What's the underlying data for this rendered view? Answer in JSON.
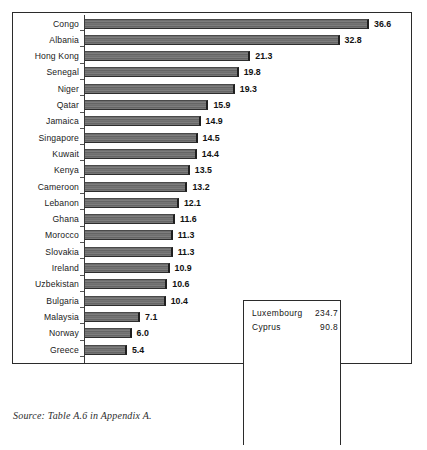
{
  "chart_data": {
    "type": "bar",
    "orientation": "horizontal",
    "title": "",
    "xlabel": "",
    "ylabel": "",
    "xlim": [
      0,
      36.6
    ],
    "grid": false,
    "legend": null,
    "categories": [
      "Congo",
      "Albania",
      "Hong Kong",
      "Senegal",
      "Niger",
      "Qatar",
      "Jamaica",
      "Singapore",
      "Kuwait",
      "Kenya",
      "Cameroon",
      "Lebanon",
      "Ghana",
      "Morocco",
      "Slovakia",
      "Ireland",
      "Uzbekistan",
      "Bulgaria",
      "Malaysia",
      "Norway",
      "Greece"
    ],
    "values": [
      36.6,
      32.8,
      21.3,
      19.8,
      19.3,
      15.9,
      14.9,
      14.5,
      14.4,
      13.5,
      13.2,
      12.1,
      11.6,
      11.3,
      11.3,
      10.9,
      10.6,
      10.4,
      7.1,
      6.0,
      5.4
    ],
    "value_labels": [
      "36.6",
      "32.8",
      "21.3",
      "19.8",
      "19.3",
      "15.9",
      "14.9",
      "14.5",
      "14.4",
      "13.5",
      "13.2",
      "12.1",
      "11.6",
      "11.3",
      "11.3",
      "10.9",
      "10.6",
      "10.4",
      "7.1",
      "6.0",
      "5.4"
    ],
    "offscale_note": {
      "rows": [
        {
          "name": "Luxembourg",
          "value": 234.7,
          "value_label": "234.7"
        },
        {
          "name": "Cyprus",
          "value": 90.8,
          "value_label": "90.8"
        }
      ]
    },
    "colors": {
      "bar_fill": "#6e6e6e",
      "bar_edge": "#1f1f1f",
      "frame": "#2b2b2b",
      "text": "#111111"
    }
  },
  "source": {
    "label": "Source:",
    "text": "Source: Table A.6 in Appendix A."
  }
}
